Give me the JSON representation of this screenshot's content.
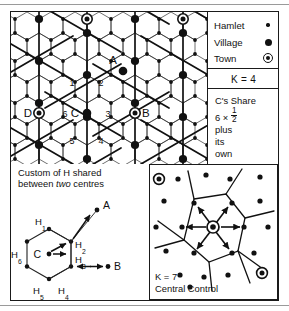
{
  "figure": {
    "top_rule": true,
    "bottom_rule": true
  },
  "legend": {
    "name": "settlement-legend",
    "rows": [
      {
        "label": "Hamlet",
        "symbol": "small-dot",
        "symbol_name": "hamlet-symbol-icon"
      },
      {
        "label": "Village",
        "symbol": "large-dot",
        "symbol_name": "village-symbol-icon"
      },
      {
        "label": "Town",
        "symbol": "circled-dot",
        "symbol_name": "town-symbol-icon"
      }
    ]
  },
  "k_value_panel": {
    "label": "K = 4"
  },
  "share_panel": {
    "line1": "C's Share",
    "line2_prefix": "6 × ",
    "line2_numerator": "1",
    "line2_denominator": "2",
    "line3": "plus",
    "line4": "its",
    "line5": "own"
  },
  "map": {
    "name": "k4-lattice-map",
    "centre_labels": [
      {
        "id": "A",
        "text": "A",
        "type": "village",
        "x": 117,
        "y": 57
      },
      {
        "id": "B",
        "text": "B",
        "type": "town",
        "x": 164,
        "y": 113
      },
      {
        "id": "C",
        "text": "C",
        "type": "village",
        "x": 79,
        "y": 113
      },
      {
        "id": "D",
        "text": "D",
        "type": "town",
        "x": 32,
        "y": 113
      }
    ],
    "hamlet_numbers": [
      "1",
      "2",
      "3",
      "4",
      "5",
      "6"
    ]
  },
  "caption": {
    "line1": "Custom of H shared",
    "line2_before": "between ",
    "line2_italic": "two",
    "line2_after": " centres"
  },
  "hex_diagram": {
    "name": "c-share-hex-diagram",
    "centre_label": "C",
    "outer_labels": [
      {
        "text": "A",
        "role": "external-centre"
      },
      {
        "text": "B",
        "role": "external-centre"
      }
    ],
    "hamlet_labels": [
      {
        "base": "H",
        "sub": "1"
      },
      {
        "base": "H",
        "sub": "2"
      },
      {
        "base": "H",
        "sub": "3"
      },
      {
        "base": "H",
        "sub": "4"
      },
      {
        "base": "H",
        "sub": "5"
      },
      {
        "base": "H",
        "sub": "6"
      }
    ]
  },
  "central_control": {
    "name": "k7-central-control-panel",
    "k_label": "K = 7",
    "caption": "Central Control"
  },
  "colors": {
    "ink": "#111111",
    "rule": "#9a9a9a",
    "paper": "#ffffff",
    "thin_line": "#222222"
  }
}
